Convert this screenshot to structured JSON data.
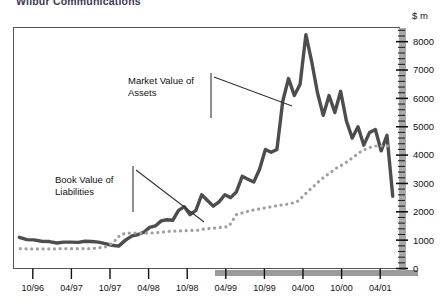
{
  "chart_data": {
    "type": "line",
    "title": "Wilbur Communications",
    "subtitle": "",
    "xlabel": "",
    "ylabel": "$ m",
    "unit_label": "$ m",
    "ylim": [
      0,
      8500
    ],
    "yticks": [
      0,
      1000,
      2000,
      3000,
      4000,
      5000,
      6000,
      7000,
      8000
    ],
    "ytick_labels": [
      "0",
      "1000",
      "2000",
      "3000",
      "4000",
      "5000",
      "6000",
      "7000",
      "8000"
    ],
    "minor_ticks_per_interval": 5,
    "grid": false,
    "legend": "none",
    "xtick_labels": [
      "10/96",
      "04/97",
      "10/97",
      "04/98",
      "10/98",
      "04/99",
      "10/99",
      "04/00",
      "10/00",
      "04/01"
    ],
    "xtick_positions": [
      1.0,
      3.0,
      5.0,
      7.0,
      9.0,
      11.0,
      13.0,
      15.0,
      17.0,
      19.0
    ],
    "xlim": [
      0,
      20
    ],
    "series": [
      {
        "name": "Market Value of Assets",
        "style": "solid",
        "color": "#4d4d4d",
        "width": 3.4,
        "x": [
          0.3,
          0.7,
          1.05,
          1.45,
          1.85,
          2.25,
          2.6,
          3.0,
          3.35,
          3.7,
          4.05,
          4.4,
          4.75,
          5.1,
          5.45,
          5.8,
          6.15,
          6.45,
          6.75,
          7.05,
          7.35,
          7.65,
          7.95,
          8.25,
          8.55,
          8.85,
          9.15,
          9.45,
          9.75,
          10.05,
          10.35,
          10.65,
          10.95,
          11.25,
          11.55,
          11.85,
          12.15,
          12.45,
          12.75,
          13.05,
          13.35,
          13.65,
          13.95,
          14.25,
          14.55,
          14.85,
          15.15,
          15.45,
          15.75,
          16.05,
          16.35,
          16.65,
          16.95,
          17.25,
          17.55,
          17.85,
          18.15,
          18.45,
          18.75,
          19.05,
          19.35,
          19.65
        ],
        "y": [
          1100,
          1020,
          1010,
          960,
          950,
          900,
          930,
          930,
          920,
          960,
          950,
          930,
          880,
          820,
          790,
          1000,
          1150,
          1200,
          1280,
          1450,
          1500,
          1680,
          1720,
          1700,
          2050,
          2180,
          1900,
          2050,
          2600,
          2400,
          2200,
          2350,
          2600,
          2500,
          2700,
          3250,
          3150,
          3050,
          3500,
          4200,
          4100,
          4200,
          5900,
          6700,
          6100,
          6500,
          8250,
          7300,
          6200,
          5400,
          6100,
          5500,
          6250,
          5200,
          4600,
          5000,
          4350,
          4800,
          4900,
          4150,
          4700,
          2550
        ]
      },
      {
        "name": "Book Value of Liabilities",
        "style": "dotted",
        "color": "#a0a0a0",
        "width": 3.2,
        "x": [
          0.35,
          0.75,
          1.15,
          1.55,
          1.95,
          2.35,
          2.75,
          3.15,
          3.55,
          3.95,
          4.35,
          4.75,
          5.15,
          5.55,
          5.95,
          6.35,
          6.75,
          7.15,
          7.55,
          7.95,
          8.35,
          8.75,
          9.15,
          9.55,
          9.95,
          10.35,
          10.75,
          11.15,
          11.55,
          11.95,
          12.35,
          12.75,
          13.15,
          13.55,
          13.95,
          14.35,
          14.75,
          15.15,
          15.55,
          15.95,
          16.35,
          16.75,
          17.15,
          17.55,
          17.95,
          18.35,
          18.75,
          19.15,
          19.55
        ],
        "y": [
          700,
          690,
          690,
          690,
          690,
          700,
          700,
          700,
          700,
          700,
          720,
          760,
          900,
          1200,
          1250,
          1250,
          1250,
          1250,
          1270,
          1300,
          1320,
          1330,
          1340,
          1350,
          1400,
          1420,
          1450,
          1480,
          1900,
          1980,
          2050,
          2100,
          2150,
          2200,
          2250,
          2280,
          2380,
          2650,
          2900,
          3150,
          3350,
          3550,
          3700,
          3900,
          4100,
          4250,
          4320,
          4330,
          4320
        ]
      }
    ],
    "annotations": [
      {
        "id": "market-value-annotation",
        "text_lines": [
          "Market Value of",
          "Assets"
        ],
        "text_x_px": 128,
        "text_y_px": 84,
        "bar_x_px": 211,
        "bar_y1_px": 73,
        "bar_y2_px": 118,
        "leader_x1_px": 214,
        "leader_y1_px": 77,
        "leader_x2_px": 292,
        "leader_y2_px": 106
      },
      {
        "id": "book-value-annotation",
        "text_lines": [
          "Book Value of",
          "Liabilities"
        ],
        "text_x_px": 55,
        "text_y_px": 183,
        "bar_x_px": 133,
        "bar_y1_px": 166,
        "bar_y2_px": 212,
        "leader_x1_px": 136,
        "leader_y1_px": 170,
        "leader_x2_px": 204,
        "leader_y2_px": 222
      }
    ]
  }
}
